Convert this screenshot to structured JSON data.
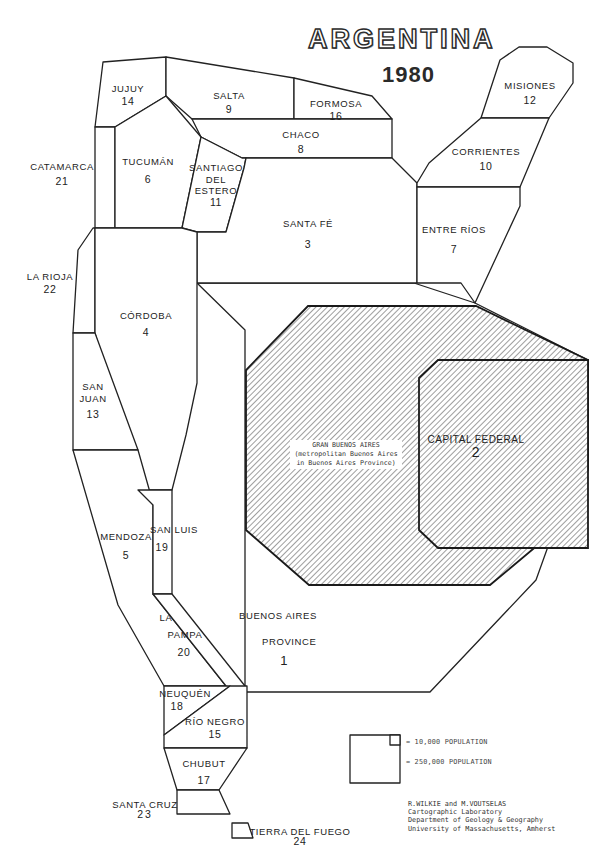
{
  "map": {
    "title": "ARGENTINA",
    "year": "1980",
    "type": "cartogram",
    "description": "Population cartogram of Argentine provinces, sized by population, ranked 1-24"
  },
  "provinces": [
    {
      "name": "JUJUY",
      "rank": "14"
    },
    {
      "name": "SALTA",
      "rank": "9"
    },
    {
      "name": "FORMOSA",
      "rank": "16"
    },
    {
      "name": "MISIONES",
      "rank": "12"
    },
    {
      "name": "CATAMARCA",
      "rank": "21"
    },
    {
      "name": "TUCUMÁN",
      "rank": "6"
    },
    {
      "name": "CHACO",
      "rank": "8"
    },
    {
      "name": "CORRIENTES",
      "rank": "10"
    },
    {
      "name_lines": [
        "SANTIAGO",
        "DEL",
        "ESTERO"
      ],
      "name": "SANTIAGO DEL ESTERO",
      "rank": "11"
    },
    {
      "name": "SANTA FÉ",
      "rank": "3"
    },
    {
      "name": "ENTRE RÍOS",
      "rank": "7"
    },
    {
      "name": "LA RIOJA",
      "rank": "22"
    },
    {
      "name": "CÓRDOBA",
      "rank": "4"
    },
    {
      "name_lines": [
        "SAN",
        "JUAN"
      ],
      "name": "SAN JUAN",
      "rank": "13"
    },
    {
      "name": "MENDOZA",
      "rank": "5"
    },
    {
      "name": "SAN LUIS",
      "rank": "19"
    },
    {
      "name_lines": [
        "LA",
        "PAMPA"
      ],
      "name": "LA PAMPA",
      "rank": "20"
    },
    {
      "name_lines": [
        "BUENOS AIRES",
        "PROVINCE"
      ],
      "name": "BUENOS AIRES PROVINCE",
      "rank": "1"
    },
    {
      "name": "CAPITAL FEDERAL",
      "rank": "2"
    },
    {
      "name": "NEUQUÉN",
      "rank": "18"
    },
    {
      "name": "RÍO NEGRO",
      "rank": "15"
    },
    {
      "name": "CHUBUT",
      "rank": "17"
    },
    {
      "name": "SANTA CRUZ",
      "rank": "23"
    },
    {
      "name": "TIERRA DEL FUEGO",
      "rank": "24"
    }
  ],
  "gran_buenos_aires": {
    "line1": "GRAN BUENOS AIRES",
    "line2": "(metropolitan Buenos Aires",
    "line3": "in Buenos Aires Province)"
  },
  "legend": {
    "small_square": "= 10,000 POPULATION",
    "large_square": "= 250,000 POPULATION"
  },
  "credits": {
    "line1": "R.WILKIE and M.VOUTSELAS",
    "line2": "Cartographic Laboratory",
    "line3": "Department of Geology & Geography",
    "line4": "University of Massachusetts, Amherst"
  },
  "colors": {
    "ink": "#222222",
    "background": "#ffffff",
    "hatch": "#555555"
  }
}
